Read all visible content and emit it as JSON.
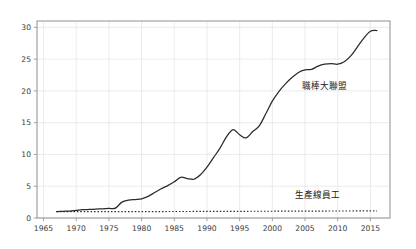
{
  "chart_data": {
    "type": "line",
    "title": "",
    "subtitle": "",
    "xlabel": "",
    "ylabel": "",
    "xlim": [
      1964,
      2018
    ],
    "ylim": [
      0,
      31
    ],
    "grid": true,
    "grid_axes": "both",
    "legend_position": "inline-annotation",
    "y_ticks": [
      0,
      5,
      10,
      15,
      20,
      25,
      30
    ],
    "y_tick_labels": [
      "0",
      "5",
      "10",
      "15",
      "20",
      "25",
      "30"
    ],
    "x_ticks": [
      1965,
      1970,
      1975,
      1980,
      1985,
      1990,
      1995,
      2000,
      2005,
      2010,
      2015
    ],
    "x_tick_labels": [
      "1965",
      "1970",
      "1975",
      "1980",
      "1985",
      "1990",
      "1995",
      "2000",
      "2005",
      "2010",
      "2015"
    ],
    "series": [
      {
        "name": "職棒大聯盟",
        "label": "職棒大聯盟",
        "style": "solid",
        "color": "#2b2b2b",
        "annotation_x": 2004.5,
        "annotation_y": 20.3,
        "x": [
          1967,
          1968,
          1969,
          1970,
          1971,
          1972,
          1973,
          1974,
          1975,
          1976,
          1977,
          1978,
          1979,
          1980,
          1981,
          1982,
          1983,
          1984,
          1985,
          1986,
          1987,
          1988,
          1989,
          1990,
          1991,
          1992,
          1993,
          1994,
          1995,
          1996,
          1997,
          1998,
          1999,
          2000,
          2001,
          2002,
          2003,
          2004,
          2005,
          2006,
          2007,
          2008,
          2009,
          2010,
          2011,
          2012,
          2013,
          2014,
          2015,
          2016
        ],
        "y": [
          1.0,
          1.05,
          1.1,
          1.2,
          1.3,
          1.35,
          1.4,
          1.45,
          1.5,
          1.55,
          2.5,
          2.8,
          2.9,
          3.0,
          3.4,
          4.0,
          4.6,
          5.1,
          5.7,
          6.4,
          6.2,
          6.1,
          6.8,
          8.0,
          9.5,
          11.0,
          12.8,
          13.9,
          13.1,
          12.6,
          13.6,
          14.5,
          16.4,
          18.4,
          19.9,
          21.1,
          22.1,
          22.9,
          23.3,
          23.4,
          23.9,
          24.2,
          24.3,
          24.2,
          24.6,
          25.5,
          26.9,
          28.3,
          29.4,
          29.5
        ]
      },
      {
        "name": "生產線員工",
        "label": "生產線員工",
        "style": "dotted",
        "color": "#2b2b2b",
        "annotation_x": 2003.5,
        "annotation_y": 3.1,
        "x": [
          1967,
          1970,
          1975,
          1980,
          1985,
          1990,
          1995,
          2000,
          2005,
          2010,
          2015,
          2016
        ],
        "y": [
          1.0,
          1.0,
          1.0,
          1.0,
          1.02,
          1.04,
          1.05,
          1.07,
          1.08,
          1.1,
          1.12,
          1.12
        ]
      }
    ]
  },
  "plot_geometry": {
    "left": 37,
    "top": 21,
    "right": 390,
    "bottom": 218
  }
}
